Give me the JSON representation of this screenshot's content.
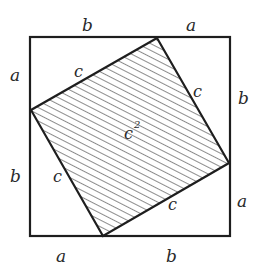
{
  "diagram": {
    "outer_square": {
      "x": 30,
      "y": 37,
      "size": 200
    },
    "inner_square": {
      "vertices": [
        [
          157,
          38
        ],
        [
          229,
          163
        ],
        [
          103,
          236
        ],
        [
          31,
          110
        ]
      ],
      "fill": "hatched",
      "area_label": "c",
      "area_exponent": "2"
    },
    "labels": {
      "top": [
        "b",
        "a"
      ],
      "right": [
        "b",
        "a"
      ],
      "bottom": [
        "a",
        "b"
      ],
      "left": [
        "a",
        "b"
      ],
      "hypotenuse": [
        "c",
        "c",
        "c",
        "c"
      ]
    },
    "colors": {
      "stroke": "#1e1e1e",
      "hatch": "#5a5a5a",
      "text": "#2a2a2a"
    }
  }
}
